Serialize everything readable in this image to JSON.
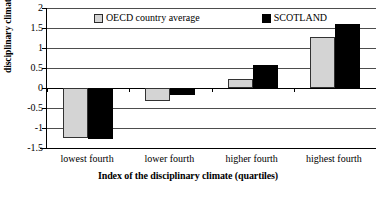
{
  "chart_data": {
    "type": "bar",
    "title": "",
    "xlabel": "Index of the disciplinary climate (quartiles)",
    "ylabel": "disciplinary climate index",
    "categories": [
      "lowest fourth",
      "lower fourth",
      "higher fourth",
      "highest fourth"
    ],
    "series": [
      {
        "name": "OECD country average",
        "color": "#d4d4d4",
        "values": [
          -1.26,
          -0.33,
          0.23,
          1.27
        ]
      },
      {
        "name": "SCOTLAND",
        "color": "#000000",
        "values": [
          -1.27,
          -0.18,
          0.57,
          1.6
        ]
      }
    ],
    "ylim": [
      -1.5,
      2.0
    ],
    "ytick_values": [
      2,
      1.5,
      1,
      0.5,
      0,
      -0.5,
      -1,
      -1.5
    ],
    "ytick_labels": [
      "2",
      "1.5",
      "1",
      "0.5",
      "0",
      "-0.5",
      "-1",
      "-1.5"
    ],
    "grid": true,
    "legend_position": "top-inside"
  },
  "legend": {
    "entries": [
      {
        "label": "OECD country average",
        "swatch": "oecd-swatch"
      },
      {
        "label": "SCOTLAND",
        "swatch": "scotland-swatch"
      }
    ]
  },
  "axes": {
    "y_title": "disciplinary climate index",
    "x_title": "Index of the disciplinary climate (quartiles)"
  },
  "footer": {
    "source_note": ""
  }
}
